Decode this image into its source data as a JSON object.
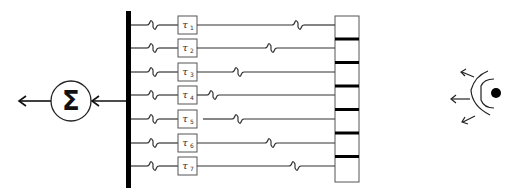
{
  "diagram": {
    "title": "",
    "summation": {
      "symbol": "Σ",
      "cx": 71,
      "cy": 101,
      "r": 20
    },
    "bus": {
      "x": 128,
      "y1": 11,
      "y2": 188,
      "width": 5
    },
    "detector_box": {
      "x": 335,
      "y": 16,
      "width": 24,
      "height": 166
    },
    "delays": [
      {
        "label": "τ",
        "sub": "1",
        "y": 25,
        "wiggle_x": 298
      },
      {
        "label": "τ",
        "sub": "2",
        "y": 48,
        "wiggle_x": 271
      },
      {
        "label": "τ",
        "sub": "3",
        "y": 72,
        "wiggle_x": 238
      },
      {
        "label": "τ",
        "sub": "4",
        "y": 95,
        "wiggle_x": 213
      },
      {
        "label": "τ",
        "sub": "5",
        "y": 119,
        "wiggle_x": 238
      },
      {
        "label": "τ",
        "sub": "6",
        "y": 143,
        "wiggle_x": 271
      },
      {
        "label": "τ",
        "sub": "7",
        "y": 166,
        "wiggle_x": 295
      }
    ],
    "source": {
      "type": "point-source-with-wavefronts",
      "cx": 496,
      "cy": 92
    },
    "colors": {
      "stroke": "#333333",
      "fill": "#000000",
      "background": "#ffffff"
    }
  }
}
